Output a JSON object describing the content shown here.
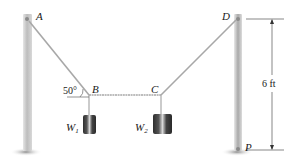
{
  "diagram": {
    "points": {
      "A": "A",
      "B": "B",
      "C": "C",
      "D": "D",
      "P": "P"
    },
    "weights": {
      "w1_main": "W",
      "w1_sub": "1",
      "w2_main": "W",
      "w2_sub": "2"
    },
    "angle_label": "50°",
    "dimension_label": "6 ft",
    "colors": {
      "post": "#c9c9c9",
      "post_shade": "#9a9a9a",
      "cable": "#a8a8a8",
      "weight_dark": "#3d3d3d",
      "ground": "#b0b0b0"
    }
  }
}
